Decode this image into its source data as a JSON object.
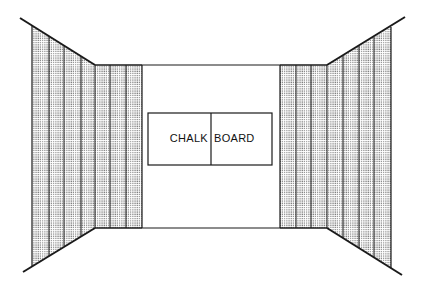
{
  "diagram": {
    "type": "room-perspective",
    "chalkboard": {
      "left_label": "CHALK",
      "right_label": "BOARD"
    },
    "colors": {
      "line": "#1a1a1a",
      "panel_dot": "#555555",
      "background": "#ffffff"
    },
    "left_wall": {
      "panels_back": 3,
      "panels_side": 4
    },
    "right_wall": {
      "panels_back": 3,
      "panels_side": 4
    }
  }
}
